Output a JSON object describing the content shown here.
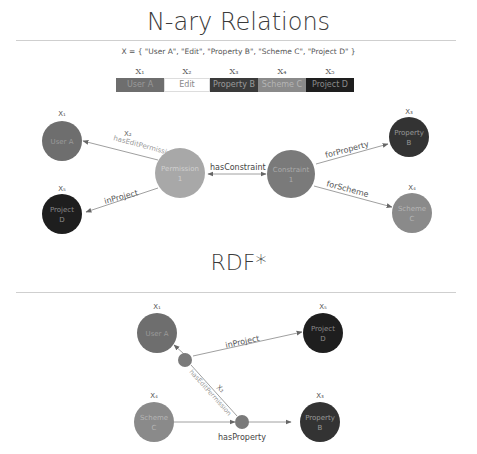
{
  "sections": {
    "nary": {
      "title": "N-ary Relations",
      "formula": "X = { \"User A\", \"Edit\", \"Property B\", \"Scheme C\", \"Project D\" }",
      "tuple": [
        {
          "sub": "X₁",
          "label": "User A",
          "color": "#6e6e6e",
          "text_color": "#9a9a9a",
          "width": 48
        },
        {
          "sub": "X₂",
          "label": "Edit",
          "color": "#ffffff",
          "text_color": "#888888",
          "width": 46
        },
        {
          "sub": "X₃",
          "label": "Property B",
          "color": "#3a3a3a",
          "text_color": "#9a9a9a",
          "width": 48
        },
        {
          "sub": "X₄",
          "label": "Scheme C",
          "color": "#8a8a8a",
          "text_color": "#b0b0b0",
          "width": 48
        },
        {
          "sub": "X₅",
          "label": "Project D",
          "color": "#1e1e1e",
          "text_color": "#8a8a8a",
          "width": 48
        }
      ],
      "nodes": {
        "user_a": {
          "line1": "User A",
          "line2": "",
          "sub": "X₁"
        },
        "project_d": {
          "line1": "Project",
          "line2": "D",
          "sub": "X₅"
        },
        "permission": {
          "line1": "Permission",
          "line2": "1"
        },
        "constraint": {
          "line1": "Constraint",
          "line2": "1"
        },
        "property_b": {
          "line1": "Property",
          "line2": "B",
          "sub": "X₃"
        },
        "scheme_c": {
          "line1": "Scheme",
          "line2": "C",
          "sub": "X₄"
        }
      },
      "edges": {
        "has_edit_permission": "hasEditPermission",
        "has_edit_permission_sub": "X₂",
        "in_project": "inProject",
        "has_constraint": "hasConstraint",
        "for_property": "forProperty",
        "for_scheme": "forScheme"
      }
    },
    "rdfstar": {
      "title": "RDF*",
      "nodes": {
        "user_a": {
          "line1": "User A",
          "line2": "",
          "sub": "X₁"
        },
        "project_d": {
          "line1": "Project",
          "line2": "D",
          "sub": "X₅"
        },
        "scheme_c": {
          "line1": "Scheme",
          "line2": "C",
          "sub": "X₄"
        },
        "property_b": {
          "line1": "Property",
          "line2": "B",
          "sub": "X₃"
        }
      },
      "edges": {
        "in_project": "inProject",
        "has_edit_permission": "hasEditPermission",
        "has_edit_permission_sub": "X₂",
        "has_property": "hasProperty"
      }
    }
  },
  "colors": {
    "user": "#6e6e6e",
    "project": "#1e1e1e",
    "permission": "#a8a8a8",
    "constraint": "#7a7a7a",
    "property": "#333333",
    "scheme": "#8a8a8a",
    "edge": "#9a9a9a"
  }
}
